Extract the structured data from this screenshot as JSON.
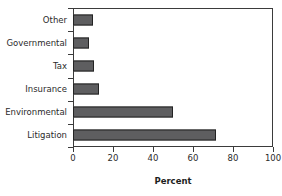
{
  "chart_data": {
    "type": "bar",
    "orientation": "horizontal",
    "title": "",
    "xlabel": "Percent",
    "ylabel": "",
    "xlim": [
      0,
      100
    ],
    "xticks": [
      0,
      20,
      40,
      60,
      80,
      100
    ],
    "grid": false,
    "legend": false,
    "categories": [
      "Other",
      "Governmental",
      "Tax",
      "Insurance",
      "Environmental",
      "Litigation"
    ],
    "values": [
      10,
      8,
      10.5,
      13,
      50,
      71.5
    ],
    "series": [
      {
        "name": "Percent",
        "values": [
          10,
          8,
          10.5,
          13,
          50,
          71.5
        ]
      }
    ],
    "colors": {
      "bar_fill": "#5e5e60",
      "bar_edge": "#232323",
      "axis": "#3b3b3b",
      "text": "#2b2b2b",
      "background": "#ffffff"
    }
  },
  "axis": {
    "x_tick_labels": [
      "0",
      "20",
      "40",
      "60",
      "80",
      "100"
    ],
    "x_title": "Percent"
  }
}
